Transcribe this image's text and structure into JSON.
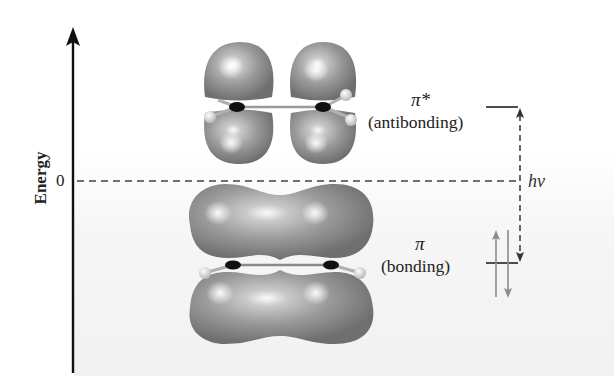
{
  "diagram": {
    "axis": {
      "label": "Energy",
      "zero_label": "0",
      "direction": "up"
    },
    "levels": [
      {
        "id": "pi-star",
        "symbol": "π*",
        "label": "(antibonding)",
        "position": "above zero",
        "electrons": 0
      },
      {
        "id": "pi",
        "symbol": "π",
        "label": "(bonding)",
        "position": "below zero",
        "electrons": 2,
        "spins": [
          "up",
          "down"
        ]
      }
    ],
    "transition": {
      "label": "hν",
      "from": "π",
      "to": "π*",
      "style": "dashed double arrow"
    },
    "colors": {
      "orbital_lobe": "#8a8a8a",
      "lobe_highlight": "#f2f2f2",
      "carbon_atom": "#111111",
      "hydrogen_atom": "#e6e6e6",
      "axis": "#111111",
      "spin_arrows": "#8c8c8c",
      "dashed_line": "#444444"
    }
  }
}
